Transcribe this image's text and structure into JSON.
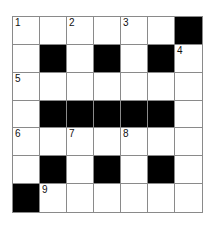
{
  "puzzle": {
    "rows": 7,
    "cols": 7,
    "layout": [
      "......#",
      ".#.#.#.",
      ".......",
      ".#####.",
      ".......",
      ".#.#.#.",
      "#......"
    ],
    "numbers": [
      {
        "row": 0,
        "col": 0,
        "n": "1"
      },
      {
        "row": 0,
        "col": 2,
        "n": "2"
      },
      {
        "row": 0,
        "col": 4,
        "n": "3"
      },
      {
        "row": 1,
        "col": 6,
        "n": "4"
      },
      {
        "row": 2,
        "col": 0,
        "n": "5"
      },
      {
        "row": 4,
        "col": 0,
        "n": "6"
      },
      {
        "row": 4,
        "col": 2,
        "n": "7"
      },
      {
        "row": 4,
        "col": 4,
        "n": "8"
      },
      {
        "row": 6,
        "col": 1,
        "n": "9"
      }
    ],
    "colors": {
      "block": "#000000",
      "line": "#8a8a8a",
      "cell": "#ffffff"
    }
  }
}
